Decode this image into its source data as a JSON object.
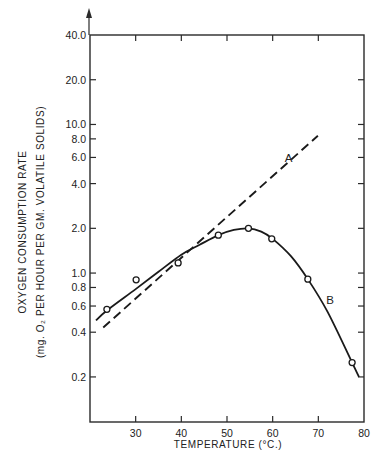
{
  "chart_data": {
    "type": "line",
    "title": "",
    "xlabel": "TEMPERATURE (°C.)",
    "ylabel_line1": "OXYGEN CONSUMPTION RATE",
    "ylabel_line2": "(mg. O₂ PER HOUR PER GM. VOLATILE SOLIDS)",
    "xscale": "linear",
    "yscale": "log",
    "xlim": [
      20,
      80
    ],
    "ylim": [
      0.12,
      40
    ],
    "grid": false,
    "legend": "none",
    "x_ticks": [
      30,
      40,
      50,
      60,
      70,
      80
    ],
    "x_tick_labels": [
      "30",
      "40",
      "50",
      "60",
      "70",
      "80"
    ],
    "y_ticks": [
      40,
      20,
      10,
      8,
      6,
      4,
      2,
      1,
      0.8,
      0.6,
      0.4,
      0.2
    ],
    "y_tick_labels": [
      "40.0",
      "20.0",
      "10.0",
      "8.0",
      "6.0",
      "4.0",
      "2.0",
      "1.0",
      "0.8",
      "0.6",
      "0.4",
      "0.2"
    ],
    "series": [
      {
        "name": "A",
        "style": "dashed",
        "kind": "fitted-line",
        "x": [
          22.9,
          69.9
        ],
        "y": [
          0.43,
          8.4
        ],
        "label_at": {
          "x": 63.5,
          "y": 5.6
        }
      },
      {
        "name": "B",
        "style": "solid",
        "kind": "smooth-curve",
        "x": [
          21.3,
          23.7,
          30.0,
          35.0,
          40.0,
          44.0,
          48.1,
          51.5,
          54.7,
          57.5,
          60.0,
          64.0,
          67.7,
          72.0,
          77.4,
          78.9
        ],
        "y": [
          0.48,
          0.56,
          0.78,
          1.02,
          1.33,
          1.55,
          1.8,
          1.95,
          2.0,
          1.9,
          1.7,
          1.3,
          0.91,
          0.55,
          0.25,
          0.2
        ],
        "label_at": {
          "x": 72.6,
          "y": 0.62
        }
      }
    ],
    "observed_points": {
      "marker": "open-circle",
      "x": [
        23.7,
        30.1,
        39.3,
        48.1,
        54.7,
        59.8,
        67.7,
        77.4
      ],
      "y": [
        0.57,
        0.9,
        1.17,
        1.8,
        2.0,
        1.7,
        0.91,
        0.25
      ]
    }
  }
}
